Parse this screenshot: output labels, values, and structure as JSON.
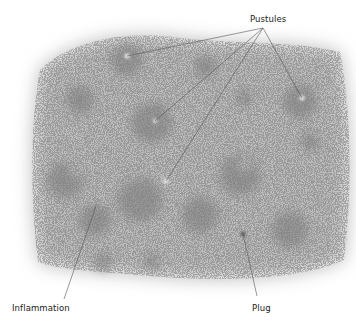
{
  "diagram": {
    "colors": {
      "background": "#ffffff",
      "skin": "#b8b8b8",
      "lesion": "#8a8a8a",
      "line": "#555555",
      "text": "#222222"
    },
    "labels": [
      {
        "id": "pustules",
        "text": "Pustules",
        "x": 250,
        "y": 14,
        "targets": [
          [
            127,
            56
          ],
          [
            155,
            121
          ],
          [
            166,
            181
          ],
          [
            302,
            98
          ]
        ],
        "anchor": [
          263,
          28
        ]
      },
      {
        "id": "inflammation",
        "text": "Inflammation",
        "x": 12,
        "y": 303,
        "targets": [
          [
            96,
            206
          ]
        ],
        "anchor": [
          64,
          299
        ]
      },
      {
        "id": "plug",
        "text": "Plug",
        "x": 252,
        "y": 303,
        "targets": [
          [
            243,
            234
          ]
        ],
        "anchor": [
          257,
          296
        ]
      }
    ]
  }
}
